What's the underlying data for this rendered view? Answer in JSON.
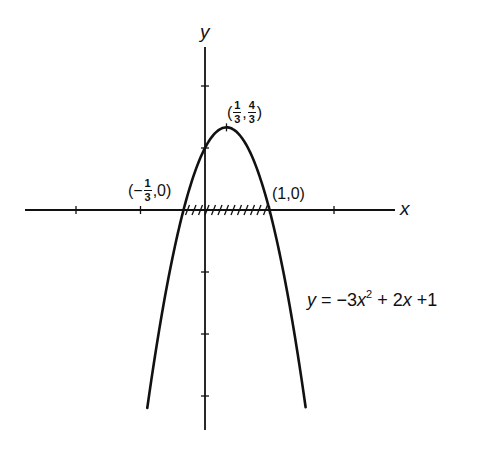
{
  "chart_data": {
    "type": "line",
    "title": "",
    "function": "y = -3x^2 + 2x + 1",
    "xlabel": "x",
    "ylabel": "y",
    "xlim": [
      -2.8,
      2.9
    ],
    "ylim": [
      -3.55,
      2.6
    ],
    "x_ticks": [
      -2,
      -1,
      1,
      2
    ],
    "y_ticks": [
      2,
      1,
      -1,
      -2,
      -3
    ],
    "grid": false,
    "legend": null,
    "series": [
      {
        "name": "y = -3x^2 + 2x + 1",
        "x_range": [
          -0.895,
          1.56
        ],
        "coefficients": {
          "a": -3,
          "b": 2,
          "c": 1
        }
      }
    ],
    "shaded_interval": {
      "from": -0.3333,
      "to": 1,
      "style": "hatch on x-axis"
    },
    "annotations": [
      {
        "label": "(-1/3, 0)",
        "x": -0.3333,
        "y": 0
      },
      {
        "label": "(1, 0)",
        "x": 1,
        "y": 0
      },
      {
        "label": "(1/3, 4/3)",
        "x": 0.3333,
        "y": 1.3333
      }
    ]
  },
  "labels": {
    "x_axis": "x",
    "y_axis": "y",
    "root_left": {
      "open": "(",
      "sign": "−",
      "num": "1",
      "den": "3",
      "rest": ",0)"
    },
    "root_right": "(1,0)",
    "vertex": {
      "open": "(",
      "x_num": "1",
      "x_den": "3",
      "sep": ",",
      "y_num": "4",
      "y_den": "3",
      "close": ")"
    },
    "equation": {
      "lhs": "y",
      "eq": " = −3",
      "x1": "x",
      "pow": "2",
      "mid": " + 2",
      "x2": "x",
      "tail": " +1"
    }
  },
  "layout": {
    "origin_px": [
      205,
      210
    ],
    "x_unit_px": 64.5,
    "y_unit_px": 62,
    "x_axis_px": [
      25,
      395
    ],
    "y_axis_px": [
      47,
      430
    ],
    "stroke": "#111111"
  }
}
